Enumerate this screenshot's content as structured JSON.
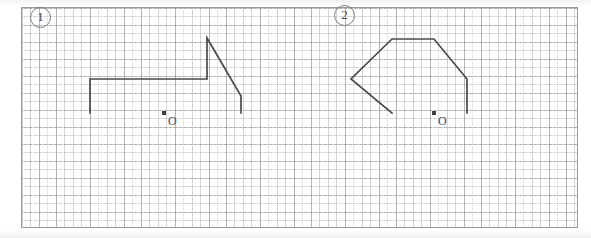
{
  "page": {
    "background_color": "#ffffff",
    "width": 591,
    "height": 238
  },
  "grid": {
    "name": "graph-paper-grid",
    "frame_color": "#9a9a9a",
    "line_color": "#8a8a8a",
    "minor_spacing_px": 8.5,
    "major_spacing_px": 17,
    "frame": {
      "left": 21,
      "top": 7,
      "width": 557,
      "height": 221
    },
    "style": "dashed"
  },
  "labels": [
    {
      "id": "one",
      "text": "①",
      "plain": "1",
      "x": 30,
      "y": 7
    },
    {
      "id": "two",
      "text": "②",
      "plain": "2",
      "x": 334,
      "y": 5
    }
  ],
  "figures": [
    {
      "id": "figure-1",
      "label": "①",
      "description": "Open polyline resembling a stepped roof profile",
      "stroke_color": "#4a4a4a",
      "stroke_width": 1.7,
      "points": [
        [
          90,
          113
        ],
        [
          90,
          79
        ],
        [
          207,
          79
        ],
        [
          207,
          38
        ],
        [
          241,
          96
        ],
        [
          241,
          113
        ]
      ]
    },
    {
      "id": "figure-2",
      "label": "②",
      "description": "Open polyline resembling a pointed-left hexagonal house profile",
      "stroke_color": "#4a4a4a",
      "stroke_width": 1.7,
      "points": [
        [
          392,
          113
        ],
        [
          351,
          79
        ],
        [
          392,
          39
        ],
        [
          434,
          39
        ],
        [
          467,
          79
        ],
        [
          467,
          113
        ]
      ]
    }
  ],
  "origins": [
    {
      "id": "origin-1",
      "letter": "O",
      "dot_x": 164,
      "dot_y": 113,
      "letter_x": 168,
      "letter_y": 115
    },
    {
      "id": "origin-2",
      "letter": "O",
      "dot_x": 434,
      "dot_y": 113,
      "letter_x": 438,
      "letter_y": 115
    }
  ]
}
